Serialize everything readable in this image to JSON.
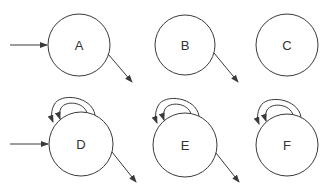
{
  "diagram": {
    "type": "state-diagram",
    "nodes": [
      {
        "id": "A",
        "label": "A",
        "incoming_arrow": true,
        "outgoing_arrow": true,
        "self_loop": false
      },
      {
        "id": "B",
        "label": "B",
        "incoming_arrow": false,
        "outgoing_arrow": true,
        "self_loop": false
      },
      {
        "id": "C",
        "label": "C",
        "incoming_arrow": false,
        "outgoing_arrow": false,
        "self_loop": false
      },
      {
        "id": "D",
        "label": "D",
        "incoming_arrow": true,
        "outgoing_arrow": true,
        "self_loop": true
      },
      {
        "id": "E",
        "label": "E",
        "incoming_arrow": false,
        "outgoing_arrow": true,
        "self_loop": true
      },
      {
        "id": "F",
        "label": "F",
        "incoming_arrow": false,
        "outgoing_arrow": false,
        "self_loop": true
      }
    ],
    "colors": {
      "stroke": "#3a3a3a",
      "text": "#333333",
      "background": "#ffffff"
    }
  }
}
